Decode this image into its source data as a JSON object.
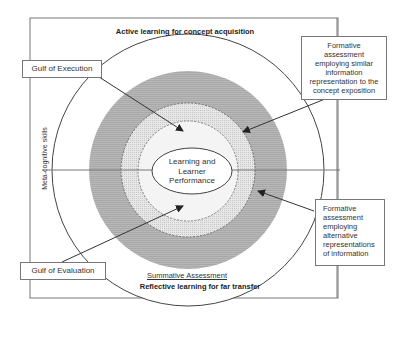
{
  "diagram": {
    "top_title": "Active learning for concept acquisition",
    "bottom_title": "Reflective learning for far transfer",
    "left_axis_label": "Meta-cognitive skills",
    "center": {
      "line1": "Learning and",
      "line2": "Learner",
      "line3": "Performance"
    },
    "outer_ring_label": "Summative Assessment",
    "callouts": {
      "gulf_execution": "Gulf of Execution",
      "gulf_evaluation": "Gulf of Evaluation",
      "formative_similar": "Formative assessment employing similar information representation to the concept exposition",
      "formative_alternative": "Formative assessment employing alternative representations of information"
    },
    "colors": {
      "frame": "#777777",
      "outer_band": "#b3b3b3",
      "inner_dotted_band": "#dedede",
      "core_zone": "#f2f2f2",
      "ellipse_fill": "#ffffff",
      "line": "#444444"
    }
  }
}
